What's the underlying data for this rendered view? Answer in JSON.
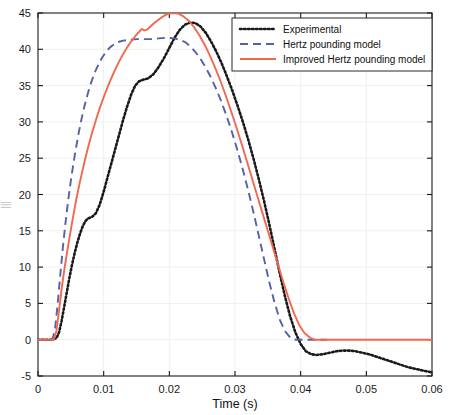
{
  "chart_data": {
    "type": "line",
    "title": "",
    "xlabel": "Time (s)",
    "ylabel": "",
    "xlim": [
      0,
      0.06
    ],
    "ylim": [
      -5,
      45
    ],
    "xticks": [
      "0",
      "0.01",
      "0.02",
      "0.03",
      "0.04",
      "0.05",
      "0.06"
    ],
    "xtick_values": [
      0,
      0.01,
      0.02,
      0.03,
      0.04,
      0.05,
      0.06
    ],
    "yticks": [
      "-5",
      "0",
      "5",
      "10",
      "15",
      "20",
      "25",
      "30",
      "35",
      "40",
      "45"
    ],
    "ytick_values": [
      -5,
      0,
      5,
      10,
      15,
      20,
      25,
      30,
      35,
      40,
      45
    ],
    "grid": true,
    "legend_position": "top-right",
    "series": [
      {
        "name": "Experimental",
        "style": "dotted",
        "color": "#1a1a1a",
        "points": [
          [
            0.0,
            0.0
          ],
          [
            0.002,
            0.0
          ],
          [
            0.0028,
            0.2
          ],
          [
            0.0032,
            1.0
          ],
          [
            0.0036,
            2.6
          ],
          [
            0.004,
            4.6
          ],
          [
            0.0044,
            6.6
          ],
          [
            0.0048,
            8.6
          ],
          [
            0.0052,
            10.4
          ],
          [
            0.0056,
            12.0
          ],
          [
            0.006,
            13.4
          ],
          [
            0.0064,
            14.6
          ],
          [
            0.0068,
            15.6
          ],
          [
            0.0072,
            16.3
          ],
          [
            0.0076,
            16.7
          ],
          [
            0.0082,
            16.9
          ],
          [
            0.0088,
            17.4
          ],
          [
            0.0094,
            18.6
          ],
          [
            0.01,
            20.4
          ],
          [
            0.0106,
            22.4
          ],
          [
            0.0112,
            24.4
          ],
          [
            0.0118,
            26.4
          ],
          [
            0.0124,
            28.4
          ],
          [
            0.013,
            30.4
          ],
          [
            0.0136,
            32.2
          ],
          [
            0.0142,
            33.8
          ],
          [
            0.0148,
            35.0
          ],
          [
            0.0154,
            35.6
          ],
          [
            0.016,
            35.8
          ],
          [
            0.0168,
            36.0
          ],
          [
            0.0176,
            36.6
          ],
          [
            0.0184,
            37.6
          ],
          [
            0.0192,
            38.8
          ],
          [
            0.02,
            40.2
          ],
          [
            0.0208,
            41.6
          ],
          [
            0.0216,
            42.7
          ],
          [
            0.0224,
            43.4
          ],
          [
            0.0232,
            43.7
          ],
          [
            0.024,
            43.6
          ],
          [
            0.0248,
            43.1
          ],
          [
            0.0256,
            42.2
          ],
          [
            0.0264,
            41.0
          ],
          [
            0.0272,
            39.6
          ],
          [
            0.028,
            38.0
          ],
          [
            0.0288,
            36.2
          ],
          [
            0.0296,
            34.3
          ],
          [
            0.0304,
            32.2
          ],
          [
            0.0312,
            30.0
          ],
          [
            0.032,
            27.6
          ],
          [
            0.0328,
            25.0
          ],
          [
            0.0336,
            22.2
          ],
          [
            0.0344,
            19.2
          ],
          [
            0.0352,
            16.0
          ],
          [
            0.036,
            12.6
          ],
          [
            0.0368,
            9.2
          ],
          [
            0.0376,
            6.0
          ],
          [
            0.0384,
            3.2
          ],
          [
            0.0392,
            1.0
          ],
          [
            0.04,
            -0.6
          ],
          [
            0.0408,
            -1.6
          ],
          [
            0.0416,
            -2.0
          ],
          [
            0.0424,
            -2.1
          ],
          [
            0.0434,
            -2.0
          ],
          [
            0.0444,
            -1.8
          ],
          [
            0.0454,
            -1.6
          ],
          [
            0.0464,
            -1.5
          ],
          [
            0.0474,
            -1.5
          ],
          [
            0.0484,
            -1.6
          ],
          [
            0.0494,
            -1.8
          ],
          [
            0.0504,
            -2.0
          ],
          [
            0.0514,
            -2.3
          ],
          [
            0.0524,
            -2.6
          ],
          [
            0.0534,
            -2.9
          ],
          [
            0.0544,
            -3.2
          ],
          [
            0.0554,
            -3.5
          ],
          [
            0.0564,
            -3.8
          ],
          [
            0.0574,
            -4.0
          ],
          [
            0.0584,
            -4.2
          ],
          [
            0.0594,
            -4.4
          ],
          [
            0.06,
            -4.5
          ]
        ]
      },
      {
        "name": "Hertz pounding model",
        "style": "dashed",
        "color": "#5560a8",
        "points": [
          [
            0.0,
            0.0
          ],
          [
            0.0022,
            0.0
          ],
          [
            0.0026,
            1.5
          ],
          [
            0.003,
            5.0
          ],
          [
            0.0034,
            9.0
          ],
          [
            0.0038,
            12.8
          ],
          [
            0.0042,
            16.2
          ],
          [
            0.0046,
            19.2
          ],
          [
            0.005,
            21.9
          ],
          [
            0.0054,
            24.3
          ],
          [
            0.0058,
            26.5
          ],
          [
            0.0062,
            28.5
          ],
          [
            0.0066,
            30.3
          ],
          [
            0.007,
            31.9
          ],
          [
            0.0074,
            33.3
          ],
          [
            0.0078,
            34.6
          ],
          [
            0.0082,
            35.7
          ],
          [
            0.0086,
            36.7
          ],
          [
            0.009,
            37.5
          ],
          [
            0.0094,
            38.3
          ],
          [
            0.0098,
            38.9
          ],
          [
            0.0104,
            39.7
          ],
          [
            0.011,
            40.3
          ],
          [
            0.0116,
            40.7
          ],
          [
            0.0122,
            41.0
          ],
          [
            0.013,
            41.2
          ],
          [
            0.014,
            41.3
          ],
          [
            0.015,
            41.4
          ],
          [
            0.016,
            41.4
          ],
          [
            0.0172,
            41.4
          ],
          [
            0.0184,
            41.5
          ],
          [
            0.0196,
            41.6
          ],
          [
            0.0208,
            41.5
          ],
          [
            0.0216,
            41.3
          ],
          [
            0.0224,
            41.0
          ],
          [
            0.0232,
            40.4
          ],
          [
            0.024,
            39.6
          ],
          [
            0.0248,
            38.6
          ],
          [
            0.0256,
            37.4
          ],
          [
            0.0264,
            36.0
          ],
          [
            0.0272,
            34.4
          ],
          [
            0.028,
            32.6
          ],
          [
            0.0288,
            30.6
          ],
          [
            0.0296,
            28.4
          ],
          [
            0.0304,
            26.0
          ],
          [
            0.0312,
            23.4
          ],
          [
            0.032,
            20.6
          ],
          [
            0.0328,
            17.6
          ],
          [
            0.0336,
            14.4
          ],
          [
            0.0344,
            11.2
          ],
          [
            0.0352,
            8.0
          ],
          [
            0.036,
            5.2
          ],
          [
            0.0368,
            2.8
          ],
          [
            0.0376,
            1.2
          ],
          [
            0.0384,
            0.3
          ],
          [
            0.0392,
            0.0
          ],
          [
            0.04,
            0.0
          ],
          [
            0.042,
            0.0
          ],
          [
            0.044,
            0.0
          ]
        ]
      },
      {
        "name": "Improved Hertz pounding model",
        "style": "solid",
        "color": "#f0694e",
        "points": [
          [
            0.0,
            0.0
          ],
          [
            0.0024,
            0.0
          ],
          [
            0.0028,
            1.2
          ],
          [
            0.0032,
            4.0
          ],
          [
            0.0036,
            7.0
          ],
          [
            0.004,
            9.6
          ],
          [
            0.0046,
            13.0
          ],
          [
            0.0052,
            16.2
          ],
          [
            0.0058,
            19.2
          ],
          [
            0.0064,
            21.8
          ],
          [
            0.007,
            24.2
          ],
          [
            0.0076,
            26.4
          ],
          [
            0.0082,
            28.4
          ],
          [
            0.0088,
            30.2
          ],
          [
            0.0094,
            31.9
          ],
          [
            0.01,
            33.4
          ],
          [
            0.0106,
            34.8
          ],
          [
            0.0112,
            36.1
          ],
          [
            0.0118,
            37.3
          ],
          [
            0.0124,
            38.4
          ],
          [
            0.013,
            39.4
          ],
          [
            0.0136,
            40.3
          ],
          [
            0.0142,
            41.1
          ],
          [
            0.0148,
            41.8
          ],
          [
            0.0154,
            42.4
          ],
          [
            0.0158,
            42.8
          ],
          [
            0.0162,
            42.6
          ],
          [
            0.0166,
            42.7
          ],
          [
            0.0172,
            43.2
          ],
          [
            0.0178,
            43.7
          ],
          [
            0.0184,
            44.1
          ],
          [
            0.019,
            44.5
          ],
          [
            0.0196,
            44.8
          ],
          [
            0.0202,
            44.95
          ],
          [
            0.0208,
            45.0
          ],
          [
            0.0214,
            44.9
          ],
          [
            0.0222,
            44.5
          ],
          [
            0.023,
            43.9
          ],
          [
            0.0238,
            43.0
          ],
          [
            0.0246,
            41.9
          ],
          [
            0.0254,
            40.6
          ],
          [
            0.0262,
            39.1
          ],
          [
            0.027,
            37.4
          ],
          [
            0.0278,
            35.6
          ],
          [
            0.0286,
            33.6
          ],
          [
            0.0294,
            31.5
          ],
          [
            0.0302,
            29.3
          ],
          [
            0.031,
            27.0
          ],
          [
            0.0318,
            24.6
          ],
          [
            0.0326,
            22.2
          ],
          [
            0.0334,
            19.8
          ],
          [
            0.0342,
            17.4
          ],
          [
            0.035,
            15.0
          ],
          [
            0.0358,
            12.6
          ],
          [
            0.0366,
            10.2
          ],
          [
            0.0374,
            7.8
          ],
          [
            0.0382,
            5.6
          ],
          [
            0.039,
            3.6
          ],
          [
            0.0398,
            2.0
          ],
          [
            0.0406,
            0.9
          ],
          [
            0.0414,
            0.3
          ],
          [
            0.042,
            0.0
          ],
          [
            0.044,
            0.0
          ],
          [
            0.048,
            0.0
          ],
          [
            0.052,
            0.0
          ],
          [
            0.056,
            0.0
          ],
          [
            0.06,
            0.0
          ]
        ]
      }
    ]
  },
  "legend": {
    "items": [
      {
        "label": "Experimental"
      },
      {
        "label": "Hertz pounding model"
      },
      {
        "label": "Improved Hertz pounding model"
      }
    ]
  },
  "axes": {
    "x_title": "Time (s)",
    "y_title_faint": "|||"
  }
}
